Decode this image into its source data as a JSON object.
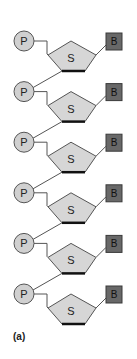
{
  "diagram": {
    "caption": "(a)",
    "unit_count": 6,
    "labels": {
      "phosphate": "P",
      "sugar": "S",
      "base": "B"
    },
    "colors": {
      "phosphate_fill": "#d0d0d0",
      "sugar_fill": "#d6d6d6",
      "base_fill": "#686868",
      "stroke": "#555555",
      "sugar_bottom_edge": "#111111"
    },
    "units": [
      {
        "phosphate": "P",
        "sugar": "S",
        "base": "B"
      },
      {
        "phosphate": "P",
        "sugar": "S",
        "base": "B"
      },
      {
        "phosphate": "P",
        "sugar": "S",
        "base": "B"
      },
      {
        "phosphate": "P",
        "sugar": "S",
        "base": "B"
      },
      {
        "phosphate": "P",
        "sugar": "S",
        "base": "B"
      },
      {
        "phosphate": "P",
        "sugar": "S",
        "base": "B"
      }
    ]
  }
}
